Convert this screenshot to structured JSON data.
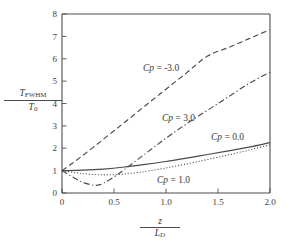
{
  "chart_data": {
    "type": "line",
    "title": "",
    "xlabel": "z / L_D",
    "ylabel": "T_FWHM / T_0",
    "xlim": [
      0,
      2.0
    ],
    "ylim": [
      0,
      8
    ],
    "grid": false,
    "legend_position": "inline-annotations",
    "xticks": [
      "0",
      "0.5",
      "1.0",
      "1.5",
      "2.0"
    ],
    "xtick_values": [
      0,
      0.5,
      1.0,
      1.5,
      2.0
    ],
    "yticks": [
      "0",
      "1",
      "2",
      "3",
      "4",
      "5",
      "6",
      "7",
      "8"
    ],
    "ytick_values": [
      0,
      1,
      2,
      3,
      4,
      5,
      6,
      7,
      8
    ],
    "series": [
      {
        "name": "Cp = -3.0",
        "style": "dashed",
        "x": [
          0,
          0.1,
          0.2,
          0.3,
          0.4,
          0.5,
          0.6,
          0.8,
          1.0,
          1.2,
          1.4,
          1.6,
          1.8,
          2.0
        ],
        "values": [
          1.0,
          1.33,
          1.68,
          2.04,
          2.41,
          2.78,
          3.15,
          3.9,
          4.64,
          5.38,
          6.12,
          6.5,
          6.9,
          7.3
        ]
      },
      {
        "name": "Cp = 3.0",
        "style": "dash-dot",
        "x": [
          0,
          0.1,
          0.2,
          0.3,
          0.35,
          0.4,
          0.5,
          0.6,
          0.8,
          1.0,
          1.2,
          1.4,
          1.6,
          1.8,
          2.0
        ],
        "values": [
          1.0,
          0.72,
          0.48,
          0.35,
          0.36,
          0.44,
          0.72,
          1.05,
          1.75,
          2.45,
          3.1,
          3.7,
          4.3,
          4.9,
          5.4
        ]
      },
      {
        "name": "Cp = 0.0",
        "style": "solid",
        "x": [
          0,
          0.2,
          0.4,
          0.6,
          0.8,
          1.0,
          1.2,
          1.4,
          1.6,
          1.8,
          2.0
        ],
        "values": [
          1.0,
          1.02,
          1.07,
          1.16,
          1.28,
          1.41,
          1.56,
          1.72,
          1.88,
          2.05,
          2.25
        ]
      },
      {
        "name": "Cp = 1.0",
        "style": "dotted",
        "x": [
          0,
          0.1,
          0.2,
          0.3,
          0.4,
          0.5,
          0.6,
          0.7,
          0.8,
          1.0,
          1.2,
          1.4,
          1.6,
          1.8,
          2.0
        ],
        "values": [
          1.0,
          0.93,
          0.87,
          0.83,
          0.81,
          0.82,
          0.85,
          0.9,
          0.96,
          1.12,
          1.3,
          1.5,
          1.7,
          1.92,
          2.15
        ]
      }
    ],
    "annotations": [
      {
        "text": "Cp = -3.0",
        "prefix": "Cp",
        "suffix": " = -3.0",
        "x_px": 143,
        "y_px": 63
      },
      {
        "text": "Cp = 3.0",
        "prefix": "Cp",
        "suffix": " = 3.0",
        "x_px": 162,
        "y_px": 113
      },
      {
        "text": "Cp = 0.0",
        "prefix": "Cp",
        "suffix": " = 0.0",
        "x_px": 211,
        "y_px": 132
      },
      {
        "text": "Cp = 1.0",
        "prefix": "Cp",
        "suffix": " = 1.0",
        "x_px": 157,
        "y_px": 175
      }
    ],
    "colors": {
      "axis": "#4d4d4d",
      "curve": "#4a4a4a",
      "background": "#ffffff",
      "text": "#3a3a3a"
    }
  },
  "axis_labels": {
    "y_numerator": "T",
    "y_numerator_sub": "FWHM",
    "y_denominator": "T",
    "y_denominator_sub": "0",
    "x_numerator": "z",
    "x_denominator": "L",
    "x_denominator_sub": "D"
  }
}
